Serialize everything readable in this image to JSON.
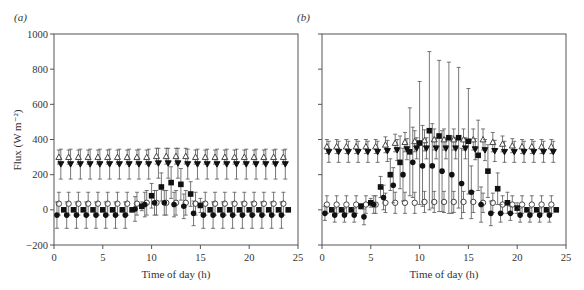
{
  "chart_data": [
    {
      "panel": "(a)",
      "type": "scatter",
      "title": "",
      "xlabel": "Time of day (h)",
      "ylabel": "Flux (W m⁻²)",
      "xlim": [
        0,
        25
      ],
      "ylim": [
        -200,
        1000
      ],
      "xticks": [
        0,
        5,
        10,
        15,
        20,
        25
      ],
      "yticks": [
        -200,
        0,
        200,
        400,
        600,
        800,
        1000
      ],
      "grid": false,
      "legend": null,
      "series": [
        {
          "name": "open-triangle",
          "marker": "triangle-open",
          "x": [
            0.5,
            1.5,
            2.5,
            3.5,
            4.5,
            5.5,
            6.5,
            7.5,
            8.5,
            9.5,
            10.5,
            11.5,
            12.5,
            13.5,
            14.5,
            15.5,
            16.5,
            17.5,
            18.5,
            19.5,
            20.5,
            21.5,
            22.5,
            23.5
          ],
          "y": [
            300,
            300,
            300,
            300,
            300,
            300,
            300,
            300,
            300,
            300,
            305,
            305,
            305,
            305,
            300,
            300,
            300,
            300,
            300,
            300,
            300,
            300,
            300,
            300
          ],
          "err": [
            40,
            40,
            40,
            40,
            40,
            40,
            40,
            40,
            40,
            40,
            45,
            45,
            45,
            45,
            40,
            40,
            40,
            40,
            40,
            40,
            40,
            40,
            40,
            40
          ]
        },
        {
          "name": "filled-down-triangle",
          "marker": "triangle-down-filled",
          "x": [
            0.7,
            1.7,
            2.7,
            3.7,
            4.7,
            5.7,
            6.7,
            7.7,
            8.7,
            9.7,
            10.7,
            11.7,
            12.7,
            13.7,
            14.7,
            15.7,
            16.7,
            17.7,
            18.7,
            19.7,
            20.7,
            21.7,
            22.7,
            23.7
          ],
          "y": [
            260,
            260,
            260,
            260,
            260,
            260,
            260,
            260,
            260,
            260,
            265,
            265,
            265,
            260,
            260,
            260,
            260,
            260,
            260,
            260,
            260,
            260,
            260,
            260
          ],
          "err": [
            85,
            85,
            85,
            85,
            85,
            85,
            85,
            85,
            85,
            85,
            85,
            85,
            85,
            85,
            85,
            85,
            85,
            85,
            85,
            85,
            85,
            85,
            85,
            85
          ]
        },
        {
          "name": "open-circle",
          "marker": "circle-open",
          "x": [
            0.5,
            1.5,
            2.5,
            3.5,
            4.5,
            5.5,
            6.5,
            7.5,
            8.5,
            9.5,
            10.5,
            11.5,
            12.5,
            13.5,
            14.5,
            15.5,
            16.5,
            17.5,
            18.5,
            19.5,
            20.5,
            21.5,
            22.5,
            23.5
          ],
          "y": [
            35,
            35,
            35,
            35,
            35,
            35,
            35,
            35,
            35,
            40,
            40,
            40,
            40,
            40,
            35,
            35,
            35,
            35,
            35,
            35,
            35,
            35,
            35,
            35
          ],
          "err": [
            65,
            65,
            65,
            65,
            65,
            65,
            65,
            65,
            65,
            70,
            70,
            70,
            70,
            70,
            65,
            65,
            65,
            65,
            65,
            65,
            65,
            65,
            65,
            65
          ]
        },
        {
          "name": "filled-square",
          "marker": "square-filled",
          "x": [
            1.0,
            2.0,
            3.0,
            4.0,
            5.0,
            6.0,
            7.0,
            8.0,
            9.0,
            10.0,
            11.0,
            12.0,
            13.0,
            14.0,
            15.0,
            16.0,
            17.0,
            18.0,
            19.0,
            20.0,
            21.0,
            22.0,
            23.0,
            24.0
          ],
          "y": [
            0,
            0,
            0,
            0,
            0,
            0,
            0,
            0,
            20,
            80,
            130,
            155,
            145,
            90,
            25,
            0,
            0,
            0,
            0,
            0,
            0,
            0,
            0,
            0
          ],
          "err": [
            8,
            8,
            8,
            8,
            8,
            8,
            8,
            8,
            25,
            70,
            80,
            90,
            90,
            70,
            40,
            10,
            8,
            8,
            8,
            8,
            8,
            8,
            8,
            8
          ]
        },
        {
          "name": "filled-circle",
          "marker": "circle-filled",
          "x": [
            0.3,
            1.3,
            2.3,
            3.3,
            4.3,
            5.3,
            6.3,
            7.3,
            8.3,
            9.3,
            10.3,
            11.3,
            12.3,
            13.3,
            14.3,
            15.3,
            16.3,
            17.3,
            18.3,
            19.3,
            20.3,
            21.3,
            22.3,
            23.3
          ],
          "y": [
            -30,
            -30,
            -30,
            -30,
            -30,
            -30,
            -30,
            -30,
            5,
            30,
            40,
            40,
            30,
            20,
            -20,
            -30,
            -30,
            -30,
            -30,
            -30,
            -30,
            -30,
            -30,
            -30
          ],
          "err": [
            75,
            75,
            75,
            75,
            75,
            75,
            75,
            75,
            70,
            70,
            70,
            70,
            70,
            70,
            70,
            75,
            75,
            75,
            75,
            75,
            75,
            75,
            75,
            75
          ]
        }
      ]
    },
    {
      "panel": "(b)",
      "type": "scatter",
      "title": "",
      "xlabel": "Time of day (h)",
      "ylabel": "",
      "xlim": [
        0,
        25
      ],
      "ylim": [
        -200,
        1000
      ],
      "xticks": [
        0,
        5,
        10,
        15,
        20,
        25
      ],
      "yticks": [
        -200,
        0,
        200,
        400,
        600,
        800,
        1000
      ],
      "grid": false,
      "legend": null,
      "series": [
        {
          "name": "open-triangle",
          "marker": "triangle-open",
          "x": [
            0.5,
            1.5,
            2.5,
            3.5,
            4.5,
            5.5,
            6.5,
            7.5,
            8.5,
            9.5,
            10.5,
            11.5,
            12.5,
            13.5,
            14.5,
            15.5,
            16.5,
            17.5,
            18.5,
            19.5,
            20.5,
            21.5,
            22.5,
            23.5
          ],
          "y": [
            360,
            360,
            360,
            360,
            360,
            360,
            370,
            380,
            385,
            390,
            395,
            400,
            400,
            400,
            400,
            400,
            400,
            385,
            375,
            365,
            360,
            360,
            360,
            360
          ],
          "err": [
            40,
            40,
            40,
            40,
            40,
            40,
            45,
            50,
            55,
            60,
            60,
            60,
            60,
            60,
            60,
            60,
            60,
            55,
            45,
            40,
            40,
            40,
            40,
            40
          ]
        },
        {
          "name": "filled-down-triangle",
          "marker": "triangle-down-filled",
          "x": [
            0.7,
            1.7,
            2.7,
            3.7,
            4.7,
            5.7,
            6.7,
            7.7,
            8.7,
            9.7,
            10.7,
            11.7,
            12.7,
            13.7,
            14.7,
            15.7,
            16.7,
            17.7,
            18.7,
            19.7,
            20.7,
            21.7,
            22.7,
            23.7
          ],
          "y": [
            330,
            330,
            330,
            330,
            330,
            330,
            335,
            340,
            345,
            350,
            350,
            350,
            350,
            350,
            350,
            345,
            340,
            335,
            330,
            330,
            330,
            330,
            330,
            330
          ],
          "err": [
            60,
            60,
            60,
            60,
            60,
            60,
            60,
            60,
            60,
            60,
            60,
            60,
            60,
            60,
            60,
            60,
            60,
            60,
            60,
            60,
            60,
            60,
            60,
            60
          ]
        },
        {
          "name": "open-circle",
          "marker": "circle-open",
          "x": [
            0.5,
            1.5,
            2.5,
            3.5,
            4.5,
            5.5,
            6.5,
            7.5,
            8.5,
            9.5,
            10.5,
            11.5,
            12.5,
            13.5,
            14.5,
            15.5,
            16.5,
            17.5,
            18.5,
            19.5,
            20.5,
            21.5,
            22.5,
            23.5
          ],
          "y": [
            30,
            30,
            30,
            30,
            30,
            30,
            40,
            40,
            40,
            40,
            45,
            45,
            45,
            45,
            45,
            45,
            40,
            40,
            30,
            30,
            30,
            30,
            30,
            30
          ],
          "err": [
            50,
            50,
            50,
            50,
            50,
            50,
            55,
            60,
            60,
            60,
            60,
            60,
            60,
            60,
            60,
            60,
            55,
            55,
            50,
            50,
            50,
            50,
            50,
            50
          ]
        },
        {
          "name": "filled-square",
          "marker": "square-filled",
          "x": [
            1.0,
            2.0,
            3.0,
            4.0,
            5.0,
            6.0,
            7.0,
            8.0,
            9.0,
            10.0,
            11.0,
            12.0,
            13.0,
            14.0,
            15.0,
            16.0,
            17.0,
            18.0,
            19.0,
            20.0,
            21.0,
            22.0,
            23.0,
            24.0
          ],
          "y": [
            0,
            0,
            0,
            20,
            40,
            130,
            200,
            270,
            330,
            380,
            450,
            420,
            410,
            410,
            390,
            310,
            220,
            120,
            40,
            10,
            0,
            0,
            0,
            0
          ],
          "err": [
            10,
            10,
            10,
            15,
            25,
            60,
            90,
            150,
            250,
            350,
            450,
            430,
            430,
            400,
            300,
            200,
            150,
            90,
            60,
            30,
            10,
            10,
            10,
            10
          ]
        },
        {
          "name": "filled-circle",
          "marker": "circle-filled",
          "x": [
            0.3,
            1.3,
            2.3,
            3.3,
            4.3,
            5.3,
            6.3,
            7.3,
            8.3,
            9.3,
            10.3,
            11.3,
            12.3,
            13.3,
            14.3,
            15.3,
            16.3,
            17.3,
            18.3,
            19.3,
            20.3,
            21.3,
            22.3,
            23.3
          ],
          "y": [
            -20,
            -30,
            -30,
            -30,
            -40,
            30,
            70,
            140,
            200,
            270,
            250,
            250,
            220,
            200,
            150,
            100,
            30,
            -20,
            -20,
            -20,
            -30,
            -30,
            -30,
            -30
          ],
          "err": [
            40,
            40,
            40,
            40,
            45,
            50,
            70,
            100,
            150,
            200,
            230,
            240,
            230,
            220,
            200,
            150,
            100,
            70,
            50,
            40,
            40,
            40,
            40,
            40
          ]
        }
      ]
    }
  ],
  "panels": {
    "a": {
      "label": "(a)",
      "xlabel": "Time of day (h)",
      "ylabel": "Flux (W m⁻²)"
    },
    "b": {
      "label": "(b)",
      "xlabel": "Time of day (h)"
    }
  }
}
